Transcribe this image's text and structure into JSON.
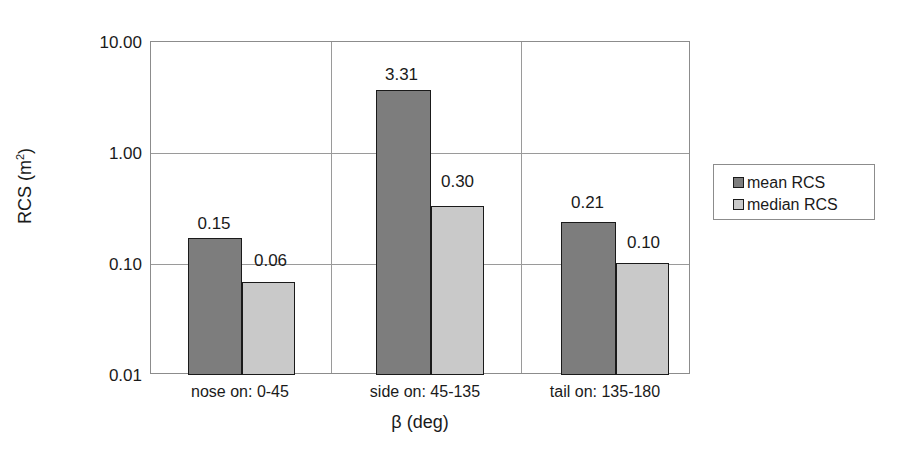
{
  "chart_data": {
    "type": "bar",
    "title": "",
    "xlabel": "β (deg)",
    "ylabel": "RCS (m²)",
    "ylabel_base": "RCS (m",
    "ylabel_sup": "2",
    "ylabel_tail": ")",
    "yscale": "log",
    "ylim": [
      0.01,
      10.0
    ],
    "ytick_labels": [
      "10.00",
      "1.00",
      "0.10",
      "0.01"
    ],
    "ytick_values": [
      10.0,
      1.0,
      0.1,
      0.01
    ],
    "grid": true,
    "legend_position": "right",
    "categories": [
      "nose on:  0-45",
      "side on: 45-135",
      "tail on: 135-180"
    ],
    "series": [
      {
        "name": "mean RCS",
        "color": "#7d7d7d",
        "values": [
          0.15,
          3.31,
          0.21
        ],
        "labels": [
          "0.15",
          "3.31",
          "0.21"
        ]
      },
      {
        "name": "median RCS",
        "color": "#c9c9c9",
        "values": [
          0.06,
          0.3,
          0.1
        ],
        "labels": [
          "0.06",
          "0.30",
          "0.10"
        ]
      }
    ]
  },
  "axis": {
    "y_ticks": [
      {
        "label": "10.00",
        "top": 34
      },
      {
        "label": "1.00",
        "top": 145
      },
      {
        "label": "0.10",
        "top": 256
      },
      {
        "label": "0.01",
        "top": 367
      }
    ],
    "x_categories": [
      {
        "label": "nose on:  0-45",
        "left": 150,
        "width": 180
      },
      {
        "label": "side on: 45-135",
        "left": 330,
        "width": 190
      },
      {
        "label": "tail on: 135-180",
        "left": 520,
        "width": 170
      }
    ]
  },
  "bars": [
    {
      "name": "bar-mean-nose",
      "series": "mean RCS",
      "label": "0.15",
      "left": 187,
      "width": 54,
      "top": 237,
      "height": 137,
      "label_left": 173,
      "label_top": 215
    },
    {
      "name": "bar-median-nose",
      "series": "median RCS",
      "label": "0.06",
      "left": 241,
      "width": 53,
      "top": 281,
      "height": 93,
      "label_left": 230,
      "label_top": 252
    },
    {
      "name": "bar-mean-side",
      "series": "mean RCS",
      "label": "3.31",
      "left": 375,
      "width": 55,
      "top": 89,
      "height": 285,
      "label_left": 360,
      "label_top": 66
    },
    {
      "name": "bar-median-side",
      "series": "median RCS",
      "label": "0.30",
      "left": 430,
      "width": 53,
      "top": 205,
      "height": 169,
      "label_left": 417,
      "label_top": 173
    },
    {
      "name": "bar-mean-tail",
      "series": "mean RCS",
      "label": "0.21",
      "left": 560,
      "width": 55,
      "top": 221,
      "height": 153,
      "label_left": 546,
      "label_top": 194
    },
    {
      "name": "bar-median-tail",
      "series": "median RCS",
      "label": "0.10",
      "left": 615,
      "width": 53,
      "top": 262,
      "height": 112,
      "label_left": 603,
      "label_top": 234
    }
  ],
  "gridlines": {
    "horizontal_tops": [
      111,
      222
    ],
    "vertical_lefts": [
      180,
      370
    ]
  },
  "legend": {
    "items": [
      {
        "label": "mean RCS",
        "color": "#7d7d7d"
      },
      {
        "label": "median RCS",
        "color": "#c9c9c9"
      }
    ]
  }
}
